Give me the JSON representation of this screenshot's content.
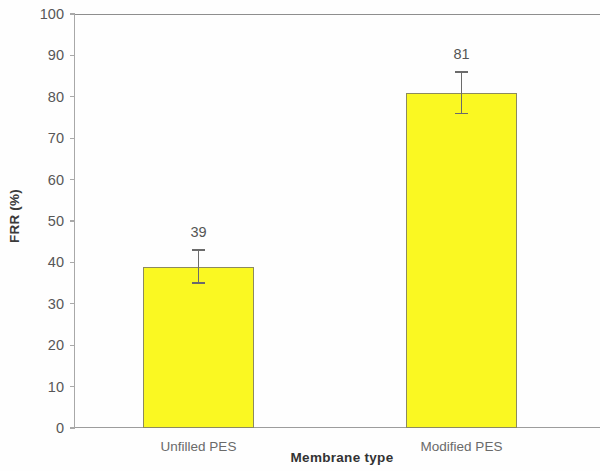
{
  "chart_data": {
    "type": "bar",
    "title": "",
    "xlabel": "Membrane type",
    "ylabel": "FRR (%)",
    "categories": [
      "Unfilled PES",
      "Modified PES"
    ],
    "values": [
      39,
      81
    ],
    "errors": [
      4,
      5
    ],
    "data_labels": [
      "39",
      "81"
    ],
    "ylim": [
      0,
      100
    ],
    "yticks": [
      0,
      10,
      20,
      30,
      40,
      50,
      60,
      70,
      80,
      90,
      100
    ],
    "ytick_labels": [
      "0",
      "10",
      "20",
      "30",
      "40",
      "50",
      "60",
      "70",
      "80",
      "90",
      "100"
    ],
    "grid": false,
    "legend": null,
    "legend_position": "none",
    "series": [
      {
        "name": "FRR",
        "values": [
          39,
          81
        ],
        "errors": [
          4,
          5
        ],
        "bar_color": "#FAF822",
        "bar_border_color": "#8C8A5F"
      }
    ],
    "colors": {
      "bar_fill": "#FAF822",
      "bar_border": "#8C8A5F",
      "axis": "#9A9A9A",
      "tick_text": "#575757",
      "title_text": "#333333",
      "error_bar": "#6B6B6B",
      "background": "#FEFEFE"
    }
  }
}
